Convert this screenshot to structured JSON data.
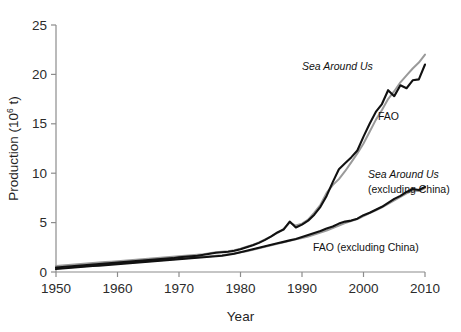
{
  "figure": {
    "background_color": "#ffffff",
    "axis_color": "#8c8c8c",
    "tick_text_color": "#2b2b2b"
  },
  "axes": {
    "x": {
      "label": "Year",
      "ticks": [
        "1950",
        "1960",
        "1970",
        "1980",
        "1990",
        "2000",
        "2010"
      ],
      "min": 1950,
      "max": 2010
    },
    "y": {
      "label_prefix": "Production (10",
      "label_exponent": "6",
      "label_suffix": " t)",
      "label_full": "Production (10^6 t)",
      "ticks": [
        "0",
        "5",
        "10",
        "15",
        "20",
        "25"
      ],
      "min": 0,
      "max": 25
    }
  },
  "annotations": {
    "sea_around_us": "Sea Around Us",
    "fao": "FAO",
    "sea_around_us_ex_china_line1": "Sea Around Us",
    "sea_around_us_ex_china_line2": "(excluding China)",
    "fao_ex_china": "FAO (excluding China)"
  },
  "colors": {
    "sea_around_us": "#111111",
    "fao": "#9a9a9a"
  },
  "chart_data": {
    "type": "line",
    "title": "",
    "xlabel": "Year",
    "ylabel": "Production (10^6 t)",
    "xlim": [
      1950,
      2010
    ],
    "ylim": [
      0,
      25
    ],
    "xticks": [
      1950,
      1960,
      1970,
      1980,
      1990,
      2000,
      2010
    ],
    "yticks": [
      0,
      5,
      10,
      15,
      20,
      25
    ],
    "grid": false,
    "legend": "inline-annotations",
    "x": [
      1950,
      1951,
      1952,
      1953,
      1954,
      1955,
      1956,
      1957,
      1958,
      1959,
      1960,
      1961,
      1962,
      1963,
      1964,
      1965,
      1966,
      1967,
      1968,
      1969,
      1970,
      1971,
      1972,
      1973,
      1974,
      1975,
      1976,
      1977,
      1978,
      1979,
      1980,
      1981,
      1982,
      1983,
      1984,
      1985,
      1986,
      1987,
      1988,
      1989,
      1990,
      1991,
      1992,
      1993,
      1994,
      1995,
      1996,
      1997,
      1998,
      1999,
      2000,
      2001,
      2002,
      2003,
      2004,
      2005,
      2006,
      2007,
      2008,
      2009,
      2010
    ],
    "series": [
      {
        "name": "Sea Around Us",
        "color": "#111111",
        "style": "solid",
        "values": [
          0.45,
          0.5,
          0.55,
          0.6,
          0.65,
          0.7,
          0.75,
          0.8,
          0.85,
          0.9,
          0.95,
          1.0,
          1.05,
          1.1,
          1.15,
          1.2,
          1.25,
          1.3,
          1.35,
          1.4,
          1.5,
          1.55,
          1.6,
          1.65,
          1.75,
          1.85,
          1.95,
          2.0,
          2.05,
          2.15,
          2.3,
          2.5,
          2.7,
          2.95,
          3.25,
          3.6,
          4.0,
          4.3,
          5.1,
          4.5,
          4.8,
          5.2,
          5.8,
          6.6,
          7.7,
          9.1,
          10.4,
          11.0,
          11.6,
          12.3,
          13.7,
          15.0,
          16.2,
          17.0,
          18.4,
          17.8,
          18.9,
          18.6,
          19.4,
          19.5,
          21.0
        ]
      },
      {
        "name": "FAO",
        "color": "#9a9a9a",
        "style": "solid",
        "values": [
          0.6,
          0.65,
          0.7,
          0.75,
          0.8,
          0.85,
          0.9,
          0.95,
          1.0,
          1.05,
          1.1,
          1.15,
          1.2,
          1.25,
          1.3,
          1.35,
          1.4,
          1.45,
          1.5,
          1.55,
          1.6,
          1.65,
          1.7,
          1.75,
          1.8,
          1.9,
          2.0,
          2.05,
          2.1,
          2.2,
          2.35,
          2.55,
          2.75,
          3.0,
          3.3,
          3.6,
          3.95,
          4.35,
          5.0,
          4.7,
          4.9,
          5.3,
          6.0,
          6.8,
          8.0,
          8.8,
          9.4,
          10.2,
          11.1,
          12.0,
          13.0,
          14.2,
          15.4,
          16.4,
          17.5,
          18.3,
          19.2,
          19.9,
          20.6,
          21.2,
          22.0
        ]
      },
      {
        "name": "Sea Around Us (excluding China)",
        "color": "#111111",
        "style": "solid",
        "values": [
          0.3,
          0.35,
          0.4,
          0.45,
          0.5,
          0.55,
          0.6,
          0.65,
          0.7,
          0.75,
          0.8,
          0.85,
          0.9,
          0.95,
          1.0,
          1.05,
          1.1,
          1.15,
          1.2,
          1.25,
          1.3,
          1.35,
          1.4,
          1.45,
          1.5,
          1.55,
          1.6,
          1.65,
          1.75,
          1.85,
          2.0,
          2.15,
          2.3,
          2.45,
          2.6,
          2.75,
          2.9,
          3.05,
          3.2,
          3.35,
          3.55,
          3.75,
          3.95,
          4.15,
          4.4,
          4.6,
          4.9,
          5.1,
          5.2,
          5.4,
          5.75,
          6.0,
          6.3,
          6.6,
          7.0,
          7.4,
          7.7,
          8.1,
          8.4,
          8.3,
          8.6
        ]
      },
      {
        "name": "FAO (excluding China)",
        "color": "#9a9a9a",
        "style": "solid",
        "values": [
          0.35,
          0.4,
          0.45,
          0.5,
          0.55,
          0.6,
          0.65,
          0.7,
          0.75,
          0.8,
          0.85,
          0.9,
          0.95,
          1.0,
          1.05,
          1.1,
          1.15,
          1.2,
          1.25,
          1.3,
          1.35,
          1.4,
          1.45,
          1.5,
          1.55,
          1.6,
          1.65,
          1.7,
          1.8,
          1.9,
          2.0,
          2.1,
          2.25,
          2.4,
          2.55,
          2.7,
          2.85,
          3.0,
          3.15,
          3.3,
          3.45,
          3.6,
          3.8,
          4.0,
          4.2,
          4.45,
          4.7,
          4.95,
          5.15,
          5.35,
          5.65,
          5.95,
          6.25,
          6.55,
          6.9,
          7.25,
          7.6,
          7.95,
          8.25,
          8.2,
          8.5
        ]
      }
    ]
  }
}
